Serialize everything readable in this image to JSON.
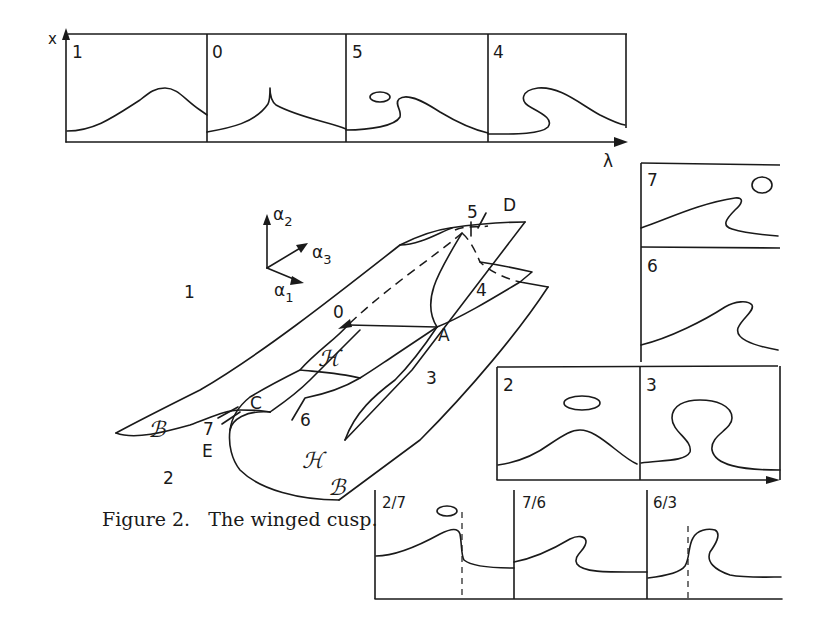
{
  "figure": {
    "caption": "Figure 2.   The winged cusp.",
    "top_axis": {
      "y_label": "x",
      "x_label": "λ"
    },
    "top_panels": [
      {
        "label": "1"
      },
      {
        "label": "0"
      },
      {
        "label": "5"
      },
      {
        "label": "4"
      }
    ],
    "right_panels": [
      {
        "label": "7"
      },
      {
        "label": "6"
      }
    ],
    "mid_panels": [
      {
        "label": "2"
      },
      {
        "label": "3"
      }
    ],
    "bottom_panels": [
      {
        "label": "2/7"
      },
      {
        "label": "7/6"
      },
      {
        "label": "6/3"
      }
    ],
    "axes3d": {
      "a1": "α",
      "a1_sub": "1",
      "a2": "α",
      "a2_sub": "2",
      "a3": "α",
      "a3_sub": "3"
    },
    "surface": {
      "region_labels": {
        "r1": "1",
        "r2": "2",
        "r3": "3",
        "r4": "4",
        "r5": "5",
        "r6": "6",
        "r7": "7",
        "r0": "0"
      },
      "point_labels": {
        "A": "A",
        "C": "C",
        "D": "D",
        "E": "E"
      },
      "surface_labels": {
        "B1": "ℬ",
        "B2": "ℬ",
        "H1": "ℋ",
        "H2": "ℋ"
      }
    }
  }
}
